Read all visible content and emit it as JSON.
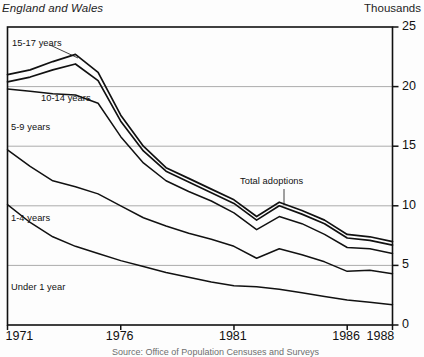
{
  "header": {
    "region_subtitle": "England and Wales",
    "units_label": "Thousands"
  },
  "axes": {
    "y_ticks": [
      "0",
      "5",
      "10",
      "15",
      "20",
      "25"
    ],
    "x_ticks": [
      "1971",
      "1976",
      "1981",
      "1986",
      "1988"
    ],
    "y_min": 0,
    "y_max": 25,
    "x_min": 1971,
    "x_max": 1988
  },
  "annotations": {
    "total": "Total adoptions",
    "a15_17": "15-17 years",
    "a10_14": "10-14 years",
    "a5_9": "5-9 years",
    "a1_4": "1-4 years",
    "under1": "Under 1 year"
  },
  "source": {
    "text": "Source: Office of Population Censuses and Surveys"
  },
  "chart_data": {
    "type": "line",
    "title": "",
    "subtitle": "England and Wales",
    "xlabel": "",
    "ylabel": "Thousands",
    "ylim": [
      0,
      25
    ],
    "xlim": [
      1971,
      1988
    ],
    "grid": "horizontal",
    "legend": "inline-annotations",
    "note": "Cumulative (stacked) curves; topmost curve is Total adoptions.",
    "x": [
      1971,
      1972,
      1973,
      1974,
      1975,
      1976,
      1977,
      1978,
      1979,
      1980,
      1981,
      1982,
      1983,
      1984,
      1985,
      1986,
      1987,
      1988
    ],
    "series": [
      {
        "name": "Total adoptions",
        "label": "15-17 years",
        "values": [
          21.0,
          21.4,
          22.1,
          22.7,
          21.2,
          17.6,
          15.0,
          13.2,
          12.3,
          11.4,
          10.5,
          9.1,
          10.3,
          9.6,
          8.8,
          7.6,
          7.4,
          7.0
        ]
      },
      {
        "name": "Cumulative to 10-14 years",
        "label": "10-14 years",
        "values": [
          20.4,
          20.8,
          21.4,
          21.9,
          20.5,
          17.1,
          14.6,
          12.9,
          12.0,
          11.1,
          10.2,
          8.8,
          10.0,
          9.3,
          8.5,
          7.3,
          7.1,
          6.7
        ]
      },
      {
        "name": "Cumulative to 5-9 years",
        "label": "5-9 years",
        "values": [
          19.8,
          19.6,
          19.4,
          19.3,
          18.6,
          15.8,
          13.6,
          12.1,
          11.2,
          10.4,
          9.4,
          8.0,
          9.1,
          8.5,
          7.6,
          6.5,
          6.4,
          6.0
        ]
      },
      {
        "name": "Cumulative to 1-4 years",
        "label": "1-4 years",
        "values": [
          14.7,
          13.3,
          12.1,
          11.6,
          11.0,
          10.0,
          9.0,
          8.3,
          7.7,
          7.2,
          6.6,
          5.6,
          6.4,
          5.9,
          5.3,
          4.5,
          4.6,
          4.3
        ]
      },
      {
        "name": "Under 1 year",
        "label": "Under 1 year",
        "values": [
          10.1,
          8.6,
          7.4,
          6.6,
          6.0,
          5.4,
          4.9,
          4.4,
          4.0,
          3.6,
          3.3,
          3.2,
          3.0,
          2.7,
          2.4,
          2.1,
          1.9,
          1.7
        ]
      }
    ]
  }
}
